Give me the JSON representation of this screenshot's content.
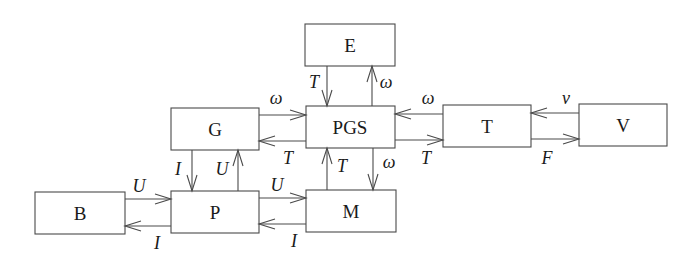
{
  "diagram": {
    "type": "block-diagram",
    "blocks": {
      "E": {
        "label": "E",
        "x": 305,
        "y": 24,
        "w": 90,
        "h": 42
      },
      "G": {
        "label": "G",
        "x": 171,
        "y": 108,
        "w": 88,
        "h": 42
      },
      "PGS": {
        "label": "PGS",
        "x": 306,
        "y": 106,
        "w": 89,
        "h": 42
      },
      "T": {
        "label": "T",
        "x": 443,
        "y": 105,
        "w": 88,
        "h": 42
      },
      "V": {
        "label": "V",
        "x": 579,
        "y": 104,
        "w": 88,
        "h": 42
      },
      "B": {
        "label": "B",
        "x": 35,
        "y": 192,
        "w": 90,
        "h": 42
      },
      "P": {
        "label": "P",
        "x": 171,
        "y": 191,
        "w": 88,
        "h": 42
      },
      "M": {
        "label": "M",
        "x": 306,
        "y": 190,
        "w": 90,
        "h": 42
      }
    },
    "signals": [
      {
        "from": "E",
        "to": "PGS",
        "label": "T"
      },
      {
        "from": "PGS",
        "to": "E",
        "label": "ω"
      },
      {
        "from": "G",
        "to": "PGS",
        "label": "ω"
      },
      {
        "from": "PGS",
        "to": "G",
        "label": "T"
      },
      {
        "from": "T",
        "to": "PGS",
        "label": "ω"
      },
      {
        "from": "PGS",
        "to": "T",
        "label": "T"
      },
      {
        "from": "V",
        "to": "T",
        "label": "v"
      },
      {
        "from": "T",
        "to": "V",
        "label": "F"
      },
      {
        "from": "G",
        "to": "P",
        "label": "I"
      },
      {
        "from": "P",
        "to": "G",
        "label": "U"
      },
      {
        "from": "M",
        "to": "PGS",
        "label": "T"
      },
      {
        "from": "PGS",
        "to": "M",
        "label": "ω"
      },
      {
        "from": "B",
        "to": "P",
        "label": "U"
      },
      {
        "from": "P",
        "to": "B",
        "label": "I"
      },
      {
        "from": "P",
        "to": "M",
        "label": "U"
      },
      {
        "from": "M",
        "to": "P",
        "label": "I"
      }
    ]
  },
  "labels": {
    "E": "E",
    "G": "G",
    "PGS": "PGS",
    "T": "T",
    "V": "V",
    "B": "B",
    "P": "P",
    "M": "M",
    "e_to_pgs": "T",
    "pgs_to_e": "ω",
    "g_to_pgs": "ω",
    "pgs_to_g": "T",
    "t_to_pgs": "ω",
    "pgs_to_t": "T",
    "v_to_t": "v",
    "t_to_v": "F",
    "g_to_p": "I",
    "p_to_g": "U",
    "m_to_pgs": "T",
    "pgs_to_m": "ω",
    "b_to_p": "U",
    "p_to_b": "I",
    "p_to_m": "U",
    "m_to_p": "I"
  }
}
